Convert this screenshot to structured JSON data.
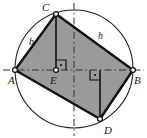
{
  "figure": {
    "canvas": {
      "width": 147,
      "height": 138
    },
    "colors": {
      "background": "#ffffff",
      "fill": "#9a9a9a",
      "stroke": "#111111",
      "circle_stroke": "#222222",
      "axis_stroke": "#333333",
      "label": "#1a1a1a",
      "vertex_fill": "#ffffff"
    },
    "circle": {
      "cx": 74,
      "cy": 69,
      "r": 59
    },
    "points": [
      {
        "id": "A",
        "label": "A",
        "x": 15,
        "y": 70,
        "label_x": 8,
        "label_y": 84,
        "marker": "open-dot"
      },
      {
        "id": "C",
        "label": "C",
        "x": 56,
        "y": 14,
        "label_x": 42,
        "label_y": 11,
        "marker": "open-dot"
      },
      {
        "id": "B",
        "label": "B",
        "x": 133,
        "y": 70,
        "label_x": 134,
        "label_y": 84,
        "marker": "open-dot"
      },
      {
        "id": "D",
        "label": "D",
        "x": 100,
        "y": 119,
        "label_x": 104,
        "label_y": 134,
        "marker": "open-dot"
      },
      {
        "id": "E",
        "label": "E",
        "x": 56,
        "y": 70,
        "label_x": 50,
        "label_y": 84,
        "marker": "open-dot"
      }
    ],
    "quadrilateral": {
      "name": "ACBD",
      "vertices": [
        "A",
        "C",
        "B",
        "D"
      ],
      "filled": true
    },
    "segments": [
      {
        "id": "AC",
        "from": "A",
        "to": "C",
        "style": "solid-heavy"
      },
      {
        "id": "CB",
        "from": "C",
        "to": "B",
        "style": "solid-heavy"
      },
      {
        "id": "BD",
        "from": "B",
        "to": "D",
        "style": "solid-heavy"
      },
      {
        "id": "DA",
        "from": "D",
        "to": "A",
        "style": "solid-heavy"
      },
      {
        "id": "CE",
        "from": "C",
        "to": "E",
        "style": "solid-medium"
      },
      {
        "id": "FD",
        "from": "F",
        "to": "D",
        "style": "solid-medium"
      }
    ],
    "axes": [
      {
        "id": "horizontal-axis",
        "style": "dash-dot",
        "x1": 3,
        "y1": 70,
        "x2": 144,
        "y2": 70
      },
      {
        "id": "vertical-axis",
        "style": "dash-dot",
        "x1": 74,
        "y1": 3,
        "x2": 74,
        "y2": 136
      }
    ],
    "right_angles": [
      {
        "id": "right-angle-at-E",
        "x": 56,
        "y": 70,
        "dir": "up-right",
        "size": 10
      },
      {
        "id": "right-angle-at-F",
        "x": 100,
        "y": 70,
        "dir": "down-left",
        "size": 10
      }
    ],
    "side_labels": [
      {
        "id": "label-b",
        "text": "b",
        "x": 29,
        "y": 45,
        "on": "AC"
      },
      {
        "id": "label-h",
        "text": "h",
        "x": 98,
        "y": 39,
        "on": "CB"
      }
    ]
  }
}
